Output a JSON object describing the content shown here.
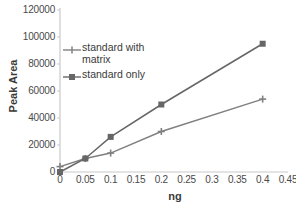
{
  "chart_data": {
    "type": "line",
    "title": "",
    "xlabel": "ng",
    "ylabel": "Peak Area",
    "x": [
      0,
      0.05,
      0.1,
      0.2,
      0.4
    ],
    "xlim": [
      0,
      0.45
    ],
    "ylim": [
      0,
      120000
    ],
    "grid": false,
    "legend_position": "inside-upper-left",
    "xticks": [
      "0",
      "0.05",
      "0.1",
      "0.15",
      "0.2",
      "0.25",
      "0.3",
      "0.35",
      "0.4",
      "0.45"
    ],
    "xtick_values": [
      0,
      0.05,
      0.1,
      0.15,
      0.2,
      0.25,
      0.3,
      0.35,
      0.4,
      0.45
    ],
    "yticks": [
      "0",
      "20000",
      "40000",
      "60000",
      "80000",
      "100000",
      "120000"
    ],
    "ytick_values": [
      0,
      20000,
      40000,
      60000,
      80000,
      100000,
      120000
    ],
    "series": [
      {
        "name": "standard with\nmatrix",
        "legend_label": "standard with\nmatrix",
        "marker": "plus",
        "color": "#808080",
        "x": [
          0,
          0.05,
          0.1,
          0.2,
          0.4
        ],
        "values": [
          4000,
          10000,
          14000,
          30000,
          54000
        ]
      },
      {
        "name": "standard only",
        "legend_label": "standard only",
        "marker": "square",
        "color": "#666666",
        "x": [
          0,
          0.05,
          0.1,
          0.2,
          0.4
        ],
        "values": [
          0,
          10000,
          26000,
          50000,
          95000
        ]
      }
    ]
  },
  "axes": {
    "y_title": "Peak Area",
    "x_title": "ng"
  }
}
